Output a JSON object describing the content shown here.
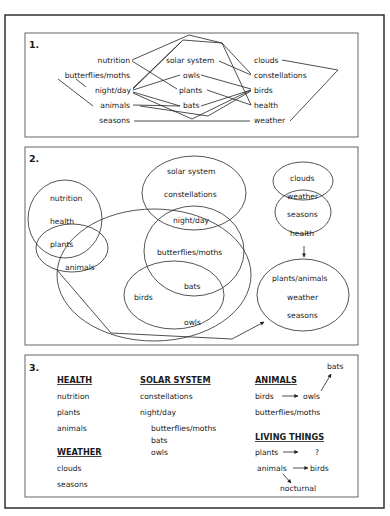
{
  "section1": {
    "number": "1.",
    "left_column": [
      "nutrition",
      "butterflies/moths",
      "night/day",
      "animals",
      "seasons"
    ],
    "middle_column": [
      "solar system",
      "owls",
      "plants",
      "bats"
    ],
    "right_column": [
      "clouds",
      "constellations",
      "birds",
      "health",
      "weather"
    ]
  },
  "section2": {
    "number": "2.",
    "clusters": {
      "health_group": [
        "nutrition",
        "health"
      ],
      "plants_animals_group": [
        "plants",
        "animals"
      ],
      "solar_group": [
        "solar system",
        "constellations"
      ],
      "nightday_group": [
        "night/day",
        "butterflies/moths"
      ],
      "birds_group": [
        "birds",
        "bats",
        "owls"
      ],
      "weather_group": [
        "clouds",
        "weather",
        "seasons",
        "health"
      ],
      "result_group": [
        "plants/animals",
        "weather",
        "seasons"
      ]
    }
  },
  "section3": {
    "number": "3.",
    "health": {
      "heading": "HEALTH",
      "items": [
        "nutrition",
        "plants",
        "animals"
      ]
    },
    "weather": {
      "heading": "WEATHER",
      "items": [
        "clouds",
        "seasons"
      ]
    },
    "solar_system": {
      "heading": "SOLAR SYSTEM",
      "items": [
        "constellations",
        "night/day"
      ],
      "sub_items": [
        "butterflies/moths",
        "bats",
        "owls"
      ]
    },
    "animals": {
      "heading": "ANIMALS",
      "birds": "birds",
      "owls": "owls",
      "bats": "bats",
      "butterflies": "butterflies/moths"
    },
    "living_things": {
      "heading": "LIVING THINGS",
      "plants": "plants",
      "unknown": "?",
      "animals": "animals",
      "birds": "birds",
      "nocturnal": "nocturnal"
    }
  }
}
